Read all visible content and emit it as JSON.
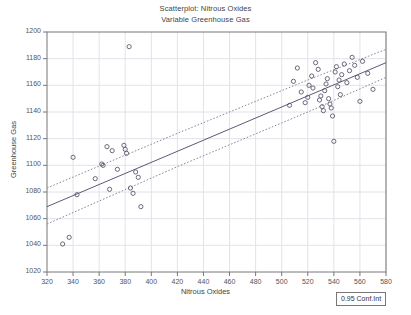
{
  "chart_data": {
    "type": "scatter",
    "title": "Scatterplot: Nitrous Oxides",
    "subtitle": "Variable Greenhouse Gas",
    "xlabel": "Nitrous Oxides",
    "ylabel": "Greenhouse Gas",
    "xlim": [
      320,
      580
    ],
    "ylim": [
      1020,
      1200
    ],
    "xticks": [
      320,
      340,
      360,
      380,
      400,
      420,
      440,
      460,
      480,
      500,
      520,
      540,
      560,
      580
    ],
    "yticks": [
      1020,
      1040,
      1060,
      1080,
      1100,
      1120,
      1140,
      1160,
      1180,
      1200
    ],
    "grid": true,
    "legend_position": "bottom-right",
    "legend_label": "0.95 Conf.Int",
    "marker": "open-circle",
    "marker_color": "#5a5a6e",
    "regression_line": {
      "label": "regression",
      "style": "solid",
      "color": "#5a5a78",
      "x": [
        320,
        580
      ],
      "y": [
        1069,
        1177
      ]
    },
    "confidence_band_upper": {
      "label": "0.95 Conf.Int upper",
      "style": "dotted",
      "color": "#8a8a9e",
      "x": [
        320,
        420,
        520,
        580
      ],
      "y": [
        1083,
        1124,
        1164,
        1187
      ]
    },
    "confidence_band_lower": {
      "label": "0.95 Conf.Int lower",
      "style": "dotted",
      "color": "#8a8a9e",
      "x": [
        320,
        420,
        520,
        580
      ],
      "y": [
        1056,
        1099,
        1140,
        1166
      ]
    },
    "points": [
      [
        332,
        1041
      ],
      [
        337,
        1046
      ],
      [
        340,
        1106
      ],
      [
        343,
        1078
      ],
      [
        357,
        1090
      ],
      [
        362,
        1101
      ],
      [
        363,
        1100
      ],
      [
        366,
        1114
      ],
      [
        368,
        1082
      ],
      [
        370,
        1111
      ],
      [
        374,
        1097
      ],
      [
        379,
        1115
      ],
      [
        380,
        1112
      ],
      [
        381,
        1109
      ],
      [
        383,
        1189
      ],
      [
        384,
        1083
      ],
      [
        386,
        1079
      ],
      [
        388,
        1095
      ],
      [
        390,
        1091
      ],
      [
        392,
        1069
      ],
      [
        506,
        1145
      ],
      [
        509,
        1163
      ],
      [
        512,
        1173
      ],
      [
        515,
        1155
      ],
      [
        518,
        1147
      ],
      [
        520,
        1151
      ],
      [
        521,
        1160
      ],
      [
        523,
        1167
      ],
      [
        524,
        1158
      ],
      [
        526,
        1177
      ],
      [
        528,
        1172
      ],
      [
        529,
        1149
      ],
      [
        530,
        1152
      ],
      [
        531,
        1144
      ],
      [
        532,
        1141
      ],
      [
        533,
        1156
      ],
      [
        534,
        1161
      ],
      [
        535,
        1165
      ],
      [
        536,
        1150
      ],
      [
        537,
        1146
      ],
      [
        538,
        1143
      ],
      [
        539,
        1137
      ],
      [
        540,
        1118
      ],
      [
        541,
        1170
      ],
      [
        542,
        1174
      ],
      [
        543,
        1159
      ],
      [
        544,
        1164
      ],
      [
        545,
        1153
      ],
      [
        546,
        1168
      ],
      [
        548,
        1176
      ],
      [
        550,
        1162
      ],
      [
        552,
        1171
      ],
      [
        554,
        1181
      ],
      [
        556,
        1175
      ],
      [
        558,
        1166
      ],
      [
        560,
        1148
      ],
      [
        562,
        1178
      ],
      [
        566,
        1169
      ],
      [
        570,
        1157
      ]
    ]
  }
}
